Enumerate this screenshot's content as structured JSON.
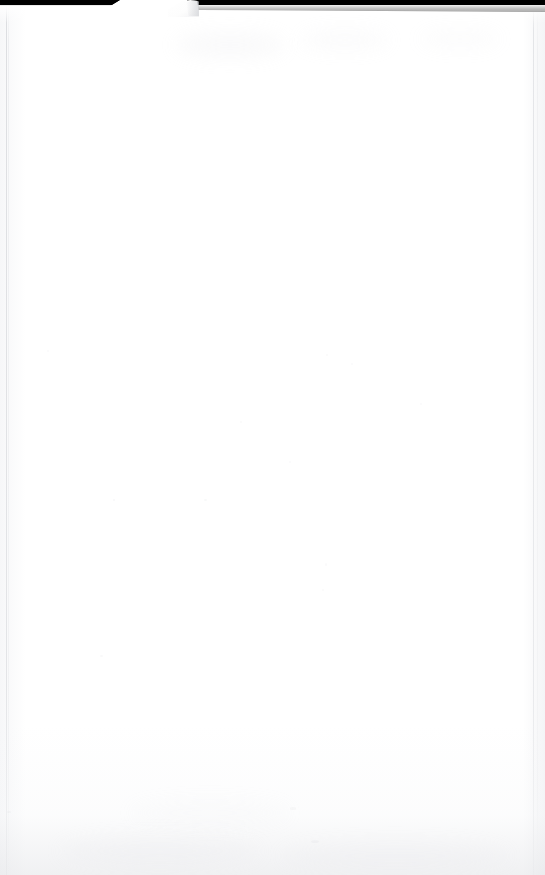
{
  "document": {
    "kind": "scanned-page",
    "page_state": "blank",
    "visible_text": "",
    "body_text": "",
    "page_number": "",
    "header_text": "",
    "footer_text": "",
    "annotations": []
  },
  "scan": {
    "backdrop_label": "scanner-lid-black-background",
    "paper_label": "white-paper-sheet",
    "top_band_label": "top-black-band",
    "folded_corner_label": "dog-eared-top-left-corner",
    "left_edge_label": "left-page-edge-line",
    "right_edge_label": "right-page-edge-line",
    "bottom_shadow_label": "bottom-scan-shadow"
  },
  "colors": {
    "paper_white": "#ffffff",
    "paper_offwhite": "#fdfdfd",
    "backdrop_black": "#000000",
    "edge_gray": "#c6c8cd",
    "shadow_gray": "#e4e5e8",
    "fold_gray": "#efeff1",
    "speck_gray": "#aaacb2"
  },
  "geometry": {
    "width_px": "545",
    "height_px": "875",
    "top_band_height_left_px": "6",
    "top_band_height_right_px": "12",
    "fold_left_px": "168",
    "fold_right_px": "204",
    "left_edge_x_px": "6",
    "right_edge_x_px": "533"
  },
  "specks": [
    {
      "x": "113",
      "y": "499",
      "w": "2",
      "h": "2",
      "o": "0.26"
    },
    {
      "x": "289",
      "y": "461",
      "w": "2",
      "h": "2",
      "o": "0.22"
    },
    {
      "x": "204",
      "y": "499",
      "w": "3",
      "h": "2",
      "o": "0.30"
    },
    {
      "x": "326",
      "y": "354",
      "w": "2",
      "h": "2",
      "o": "0.20"
    },
    {
      "x": "325",
      "y": "563",
      "w": "2",
      "h": "3",
      "o": "0.24"
    },
    {
      "x": "322",
      "y": "589",
      "w": "2",
      "h": "2",
      "o": "0.20"
    },
    {
      "x": "100",
      "y": "655",
      "w": "3",
      "h": "2",
      "o": "0.22"
    },
    {
      "x": "351",
      "y": "363",
      "w": "2",
      "h": "2",
      "o": "0.18"
    },
    {
      "x": "420",
      "y": "403",
      "w": "2",
      "h": "2",
      "o": "0.18"
    },
    {
      "x": "240",
      "y": "421",
      "w": "2",
      "h": "2",
      "o": "0.20"
    },
    {
      "x": "311",
      "y": "840",
      "w": "8",
      "h": "3",
      "o": "0.22"
    },
    {
      "x": "290",
      "y": "807",
      "w": "6",
      "h": "3",
      "o": "0.20"
    },
    {
      "x": "47",
      "y": "350",
      "w": "2",
      "h": "2",
      "o": "0.18"
    },
    {
      "x": "7",
      "y": "811",
      "w": "4",
      "h": "2",
      "o": "0.24"
    }
  ],
  "smudges": [
    {
      "x": "175",
      "y": "32",
      "w": "110",
      "h": "26",
      "o": "0.40"
    },
    {
      "x": "300",
      "y": "30",
      "w": "90",
      "h": "20",
      "o": "0.30"
    },
    {
      "x": "420",
      "y": "30",
      "w": "80",
      "h": "18",
      "o": "0.26"
    },
    {
      "x": "60",
      "y": "836",
      "w": "200",
      "h": "30",
      "o": "0.34"
    },
    {
      "x": "280",
      "y": "842",
      "w": "230",
      "h": "28",
      "o": "0.30"
    },
    {
      "x": "130",
      "y": "800",
      "w": "160",
      "h": "26",
      "o": "0.22"
    }
  ]
}
